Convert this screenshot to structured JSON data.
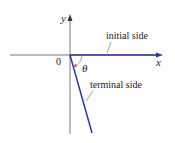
{
  "labels": {
    "y_axis": "y",
    "x_axis": "x",
    "origin": "0",
    "angle": "θ",
    "initial_side": "initial side",
    "terminal_side": "terminal side"
  },
  "colors": {
    "axis": "#333333",
    "ray": "#2b3a9c",
    "arc": "#d9534f"
  }
}
